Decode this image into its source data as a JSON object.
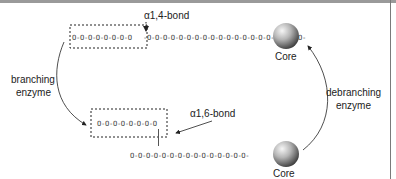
{
  "diagram": {
    "top_panel": {
      "bond_label": "α1,4-bond",
      "core_label": "Core",
      "chain_segment_in_box": "O-O-O-O-O-O-O-O",
      "chain_segment_outside": "-O-O-O-O-O-O-O-O-O-O-O-O-O-O-O-O-O-O-O-O-"
    },
    "bottom_panel": {
      "bond_label": "α1,6-bond",
      "core_label": "Core",
      "branch_chain": "O-O-O-O-O-O-O-O",
      "main_chain": "O-O-O-O-O-O-O-O-O-O-O-O-O-O-O-"
    },
    "left_arrow": {
      "label_line1": "branching",
      "label_line2": "enzyme"
    },
    "right_arrow": {
      "label_line1": "debranching",
      "label_line2": "enzyme"
    },
    "colors": {
      "text": "#222222",
      "chain": "#444444",
      "dashed_box": "#222222",
      "sphere_light": "#f4f4f4",
      "sphere_dark": "#3a3a3a"
    }
  }
}
